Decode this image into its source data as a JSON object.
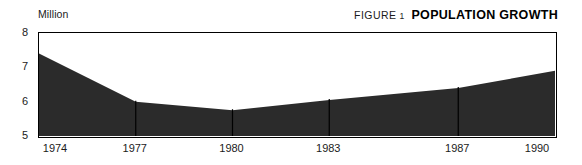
{
  "header": {
    "unit_label": "Million",
    "figure_label": "FIGURE",
    "figure_number": "1",
    "title": "POPULATION GROWTH"
  },
  "colors": {
    "area_fill": "#2b2b2b",
    "frame": "#000000",
    "text": "#1b1b1b",
    "background": "#ffffff"
  },
  "chart_data": {
    "type": "area",
    "title": "POPULATION GROWTH",
    "xlabel": "",
    "ylabel": "Million",
    "ylim": [
      5,
      8
    ],
    "xlim": [
      1974,
      1990
    ],
    "yticks": [
      5,
      6,
      7,
      8
    ],
    "xticks": [
      1974,
      1977,
      1980,
      1983,
      1987,
      1990
    ],
    "grid": false,
    "legend": "none",
    "x": [
      1974,
      1977,
      1980,
      1983,
      1987,
      1990
    ],
    "values": [
      7.4,
      6.0,
      5.75,
      6.05,
      6.4,
      6.9
    ],
    "series": [
      {
        "name": "Population",
        "values": [
          7.4,
          6.0,
          5.75,
          6.05,
          6.4,
          6.9
        ]
      }
    ]
  }
}
